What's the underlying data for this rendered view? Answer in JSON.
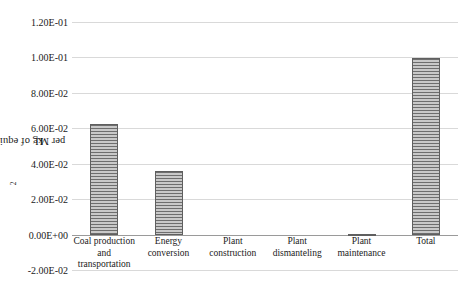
{
  "chart_data": {
    "type": "bar",
    "title": "",
    "subtitle": "",
    "xlabel": "",
    "ylabel": "kg of equivalent CO2 per MJ",
    "ylabel_parts": {
      "before": "kg of equivalent CO",
      "subscript": "2",
      "after": " per MJ"
    },
    "categories": [
      "Coal production and transportation",
      "Energy conversion",
      "Plant construction",
      "Plant dismanteling",
      "Plant maintenance",
      "Total"
    ],
    "category_lines": [
      [
        "Coal production",
        "and",
        "transportation"
      ],
      [
        "Energy",
        "conversion"
      ],
      [
        "Plant",
        "construction"
      ],
      [
        "Plant",
        "dismanteling"
      ],
      [
        "Plant",
        "maintenance"
      ],
      [
        "Total"
      ]
    ],
    "values": [
      0.0622,
      0.0357,
      0.0,
      0.0,
      0.0005,
      0.0995
    ],
    "ylim": [
      -0.02,
      0.12
    ],
    "ytick_values": [
      0.12,
      0.1,
      0.08,
      0.06,
      0.04,
      0.02,
      0.0,
      -0.02
    ],
    "ytick_labels": [
      "1.20E-01",
      "1.00E-01",
      "8.00E-02",
      "6.00E-02",
      "4.00E-02",
      "2.00E-02",
      "0.00E+00",
      "-2.00E-02"
    ],
    "grid": true,
    "legend": false,
    "legend_position": "none",
    "series": [
      {
        "name": "kg of equivalent CO2 per MJ",
        "values": [
          0.0622,
          0.0357,
          0.0,
          0.0,
          0.0005,
          0.0995
        ]
      }
    ]
  },
  "style": {
    "bar_fill": "#b9b9b9",
    "bar_hatch_color": "#6e6e6e",
    "bar_border": "#5f5f5f",
    "gridline_color": "#d9d9d9",
    "axis_color": "#9a9a9a",
    "text_color": "#1a1a1a",
    "background": "#ffffff"
  }
}
